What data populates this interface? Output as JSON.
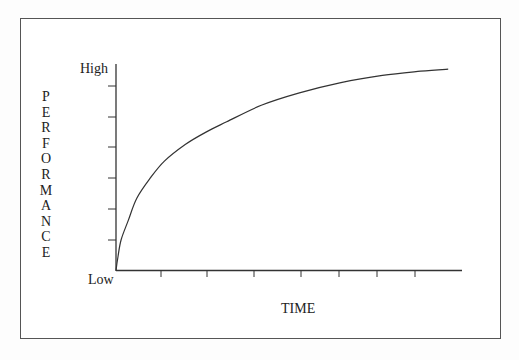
{
  "chart_data": {
    "type": "line",
    "title": "",
    "xlabel": "TIME",
    "ylabel": "PERFORMANCE",
    "y_tick_labels": {
      "top": "High",
      "bottom": "Low"
    },
    "x_ticks_count": 7,
    "y_ticks_count": 6,
    "grid": false,
    "legend": null,
    "series": [
      {
        "name": "performance-over-time",
        "description": "Concave increasing curve (diminishing returns) from Low toward High",
        "x": [
          0,
          0.006,
          0.015,
          0.035,
          0.06,
          0.1,
          0.14,
          0.2,
          0.26,
          0.32,
          0.42,
          0.53,
          0.65,
          0.77,
          0.88,
          0.96
        ],
        "y": [
          0,
          0.07,
          0.15,
          0.24,
          0.35,
          0.45,
          0.53,
          0.61,
          0.67,
          0.72,
          0.8,
          0.86,
          0.91,
          0.945,
          0.965,
          0.975
        ]
      }
    ],
    "xlim": [
      0,
      1
    ],
    "ylim": [
      0,
      1
    ]
  },
  "labels": {
    "high": "High",
    "low": "Low",
    "x_axis": "TIME",
    "y_axis_letters": [
      "P",
      "E",
      "R",
      "F",
      "O",
      "R",
      "M",
      "A",
      "N",
      "C",
      "E"
    ]
  }
}
